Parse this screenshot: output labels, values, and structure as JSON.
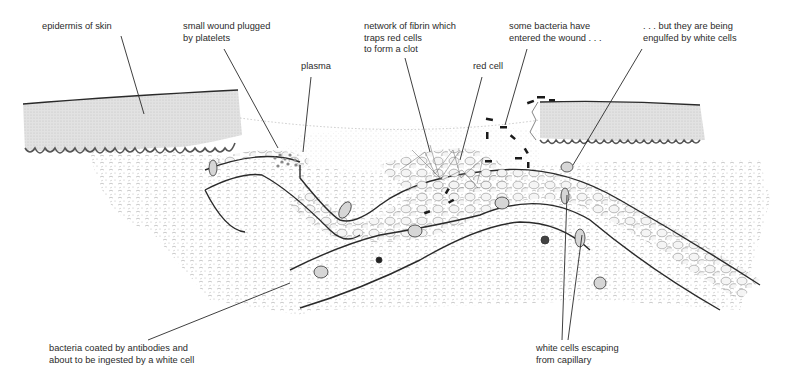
{
  "figure": {
    "labels": [
      {
        "id": "epidermis",
        "text": "epidermis of skin"
      },
      {
        "id": "wound_plug",
        "text": "small wound plugged\nby platelets"
      },
      {
        "id": "plasma",
        "text": "plasma"
      },
      {
        "id": "fibrin",
        "text": "network of fibrin which\ntraps red cells\nto form a clot"
      },
      {
        "id": "red_cell",
        "text": "red cell"
      },
      {
        "id": "bacteria_entered",
        "text": "some bacteria have\nentered the wound . . ."
      },
      {
        "id": "engulfed",
        "text": ". . . but they are being\nengulfed by white cells"
      },
      {
        "id": "antibodies",
        "text": "bacteria coated by antibodies and\nabout to be ingested by a white cell"
      },
      {
        "id": "white_cells_escaping",
        "text": "white cells escaping\nfrom capillary"
      }
    ],
    "colors": {
      "ink": "#2a2a2a",
      "epidermis_fill": "#d9d9d9",
      "tissue_stipple": "#9a9a9a",
      "background": "#ffffff"
    }
  }
}
